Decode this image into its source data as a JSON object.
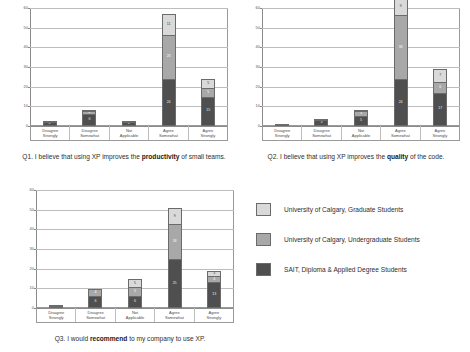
{
  "page": {
    "background": "#ffffff"
  },
  "legend": {
    "position": "right-middle",
    "items": [
      {
        "key": "grad",
        "label": "University of Calgary, Graduate Students",
        "color": "#d9d9d9"
      },
      {
        "key": "undergrad",
        "label": "University of Calgary, Undergraduate Students",
        "color": "#a8a8a8"
      },
      {
        "key": "sait",
        "label": "SAIT, Diploma & Applied Degree Students",
        "color": "#4f4f4f"
      }
    ]
  },
  "captions": {
    "q1_prefix": "Q1. I believe that using XP improves the ",
    "q1_bold": "productivity",
    "q1_suffix": " of small teams.",
    "q2_prefix": "Q2. I believe that using XP improves the ",
    "q2_bold": "quality",
    "q2_suffix": " of the code.",
    "q3_prefix": "Q3. I would ",
    "q3_bold": "recommend",
    "q3_suffix": " to my company to use XP."
  },
  "chart_data": [
    {
      "id": "q1",
      "type": "bar",
      "stacked": true,
      "title": "Q1. I believe that using XP improves the productivity of small teams.",
      "xlabel": "",
      "ylabel": "",
      "ylim": [
        0,
        60
      ],
      "yticks": [
        0,
        10,
        20,
        30,
        40,
        50,
        60
      ],
      "grid": true,
      "categories": [
        "Disagree Strongly",
        "Disagree Somewhat",
        "Not Applicable",
        "Agree Somewhat",
        "Agree Strongly"
      ],
      "series": [
        {
          "name": "SAIT, Diploma & Applied Degree Students",
          "color": "#4f4f4f",
          "values": [
            2,
            6,
            2,
            24,
            15
          ]
        },
        {
          "name": "University of Calgary, Undergraduate Students",
          "color": "#a8a8a8",
          "values": [
            1,
            2,
            1,
            23,
            5
          ]
        },
        {
          "name": "University of Calgary, Graduate Students",
          "color": "#d9d9d9",
          "values": [
            0,
            1,
            0,
            11,
            5
          ]
        }
      ]
    },
    {
      "id": "q2",
      "type": "bar",
      "stacked": true,
      "title": "Q2. I believe that using XP improves the quality of the code.",
      "xlabel": "",
      "ylabel": "",
      "ylim": [
        0,
        60
      ],
      "yticks": [
        0,
        10,
        20,
        30,
        40,
        50,
        60
      ],
      "grid": true,
      "categories": [
        "Disagree Strongly",
        "Disagree Somewhat",
        "Not Applicable",
        "Agree Somewhat",
        "Agree Strongly"
      ],
      "series": [
        {
          "name": "SAIT, Diploma & Applied Degree Students",
          "color": "#4f4f4f",
          "values": [
            1,
            3,
            5,
            24,
            17
          ]
        },
        {
          "name": "University of Calgary, Undergraduate Students",
          "color": "#a8a8a8",
          "values": [
            0,
            1,
            3,
            33,
            6
          ]
        },
        {
          "name": "University of Calgary, Graduate Students",
          "color": "#d9d9d9",
          "values": [
            0,
            0,
            1,
            9,
            7
          ]
        }
      ]
    },
    {
      "id": "q3",
      "type": "bar",
      "stacked": true,
      "title": "Q3. I would recommend to my company to use XP.",
      "xlabel": "",
      "ylabel": "",
      "ylim": [
        0,
        60
      ],
      "yticks": [
        0,
        10,
        20,
        30,
        40,
        50,
        60
      ],
      "grid": true,
      "categories": [
        "Disagree Strongly",
        "Disagree Somewhat",
        "Not Applicable",
        "Agree Somewhat",
        "Agree Strongly"
      ],
      "series": [
        {
          "name": "SAIT, Diploma & Applied Degree Students",
          "color": "#4f4f4f",
          "values": [
            1,
            6,
            6,
            25,
            13
          ]
        },
        {
          "name": "University of Calgary, Undergraduate Students",
          "color": "#a8a8a8",
          "values": [
            1,
            4,
            5,
            18,
            4
          ]
        },
        {
          "name": "University of Calgary, Graduate Students",
          "color": "#d9d9d9",
          "values": [
            0,
            0,
            5,
            9,
            3
          ]
        }
      ]
    }
  ]
}
